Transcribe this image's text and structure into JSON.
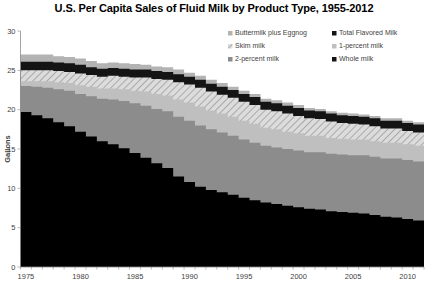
{
  "chart_data": {
    "type": "area",
    "title": "U.S. Per Capita Sales of Fluid Milk by Product Type, 1955-2012",
    "xlabel": "",
    "ylabel": "Gallons",
    "ylim": [
      0,
      30
    ],
    "xlim": [
      1975,
      2012
    ],
    "ytick_labels": [
      "0",
      "5",
      "10",
      "15",
      "20",
      "25",
      "30"
    ],
    "ytick_values": [
      0,
      5,
      10,
      15,
      20,
      25,
      30
    ],
    "xtick_labels": [
      "1975",
      "1980",
      "1985",
      "1990",
      "1995",
      "2000",
      "2005",
      "2010"
    ],
    "xtick_values": [
      1975,
      1980,
      1985,
      1990,
      1995,
      2000,
      2005,
      2010
    ],
    "grid": false,
    "legend_position": "top-right",
    "stacked": true,
    "x": [
      1975,
      1976,
      1977,
      1978,
      1979,
      1980,
      1981,
      1982,
      1983,
      1984,
      1985,
      1986,
      1987,
      1988,
      1989,
      1990,
      1991,
      1992,
      1993,
      1994,
      1995,
      1996,
      1997,
      1998,
      1999,
      2000,
      2001,
      2002,
      2003,
      2004,
      2005,
      2006,
      2007,
      2008,
      2009,
      2010,
      2011,
      2012
    ],
    "series": [
      {
        "name": "Whole milk",
        "color": "#000000",
        "pattern": "solid",
        "values": [
          19.7,
          19.3,
          18.9,
          18.4,
          17.9,
          17.2,
          16.6,
          16.0,
          15.6,
          15.1,
          14.5,
          13.9,
          13.2,
          12.6,
          11.5,
          10.8,
          10.2,
          9.8,
          9.5,
          9.2,
          8.8,
          8.5,
          8.2,
          8.0,
          7.8,
          7.6,
          7.4,
          7.3,
          7.1,
          7.0,
          6.9,
          6.8,
          6.6,
          6.4,
          6.3,
          6.1,
          5.9,
          5.8
        ]
      },
      {
        "name": "2-percent milk",
        "color": "#8c8c8c",
        "pattern": "solid",
        "values": [
          3.3,
          3.6,
          3.9,
          4.2,
          4.5,
          4.8,
          5.1,
          5.4,
          5.7,
          6.0,
          6.3,
          6.6,
          6.9,
          7.2,
          7.6,
          7.8,
          7.8,
          7.7,
          7.6,
          7.5,
          7.4,
          7.3,
          7.2,
          7.2,
          7.2,
          7.2,
          7.2,
          7.3,
          7.3,
          7.3,
          7.3,
          7.4,
          7.4,
          7.4,
          7.5,
          7.5,
          7.5,
          7.5
        ]
      },
      {
        "name": "1-percent milk",
        "color": "#bfbfbf",
        "pattern": "solid",
        "values": [
          0.6,
          0.7,
          0.8,
          0.9,
          1.0,
          1.1,
          1.2,
          1.3,
          1.4,
          1.5,
          1.6,
          1.8,
          1.9,
          2.0,
          2.2,
          2.3,
          2.4,
          2.4,
          2.4,
          2.4,
          2.4,
          2.4,
          2.3,
          2.3,
          2.2,
          2.2,
          2.1,
          2.1,
          2.0,
          2.0,
          2.0,
          2.0,
          2.0,
          2.0,
          2.0,
          2.0,
          2.0,
          2.0
        ]
      },
      {
        "name": "Skim milk",
        "color": "#d9d9d9",
        "pattern": "hatch",
        "values": [
          1.4,
          1.4,
          1.4,
          1.4,
          1.4,
          1.5,
          1.5,
          1.5,
          1.6,
          1.6,
          1.7,
          1.8,
          1.9,
          2.0,
          2.2,
          2.3,
          2.4,
          2.4,
          2.4,
          2.4,
          2.4,
          2.4,
          2.3,
          2.3,
          2.3,
          2.2,
          2.2,
          2.1,
          2.1,
          2.0,
          2.0,
          1.9,
          1.9,
          1.8,
          1.8,
          1.7,
          1.7,
          1.6
        ]
      },
      {
        "name": "Total Flavored Milk",
        "color": "#141414",
        "pattern": "solid",
        "values": [
          1.1,
          1.1,
          1.1,
          1.1,
          1.1,
          1.1,
          1.0,
          1.0,
          1.0,
          1.0,
          1.0,
          1.0,
          1.0,
          1.0,
          1.0,
          1.0,
          1.0,
          1.0,
          1.0,
          1.0,
          1.0,
          1.0,
          1.0,
          1.0,
          1.0,
          1.0,
          1.0,
          1.0,
          1.0,
          1.0,
          1.0,
          1.0,
          1.0,
          1.0,
          1.0,
          1.0,
          1.0,
          1.0
        ]
      },
      {
        "name": "Buttermilk plus Eggnog",
        "color": "#b3b3b3",
        "pattern": "solid",
        "values": [
          0.9,
          0.9,
          0.9,
          0.8,
          0.8,
          0.8,
          0.8,
          0.7,
          0.7,
          0.7,
          0.7,
          0.6,
          0.6,
          0.6,
          0.6,
          0.5,
          0.5,
          0.5,
          0.5,
          0.4,
          0.4,
          0.4,
          0.4,
          0.4,
          0.4,
          0.4,
          0.3,
          0.3,
          0.3,
          0.3,
          0.3,
          0.3,
          0.3,
          0.3,
          0.3,
          0.3,
          0.3,
          0.3
        ]
      }
    ],
    "legend": [
      {
        "label": "Buttermilk plus Eggnog",
        "color": "#b3b3b3",
        "pattern": "solid"
      },
      {
        "label": "Total Flavored Milk",
        "color": "#141414",
        "pattern": "solid"
      },
      {
        "label": "Skim milk",
        "color": "#d9d9d9",
        "pattern": "hatch"
      },
      {
        "label": "1-percent milk",
        "color": "#bfbfbf",
        "pattern": "solid"
      },
      {
        "label": "2-percent milk",
        "color": "#8c8c8c",
        "pattern": "solid"
      },
      {
        "label": "Whole milk",
        "color": "#141414",
        "pattern": "solid"
      }
    ]
  }
}
